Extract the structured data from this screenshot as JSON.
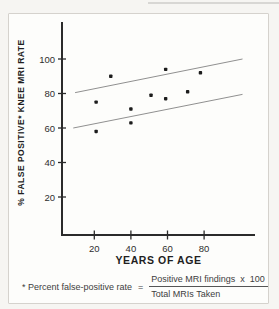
{
  "figure": {
    "y_axis_label": "% FALSE POSITIVE* KNEE MRI RATE",
    "x_axis_label": "YEARS OF AGE",
    "footnote": {
      "prefix": "* Percent false-positive rate",
      "equals": "=",
      "numerator": "Positive MRI findings  x  100",
      "denominator": "Total MRIs Taken"
    }
  },
  "chart_data": {
    "type": "scatter",
    "title": "",
    "xlabel": "YEARS OF AGE",
    "ylabel": "% FALSE POSITIVE* KNEE MRI RATE",
    "xlim": [
      0,
      108
    ],
    "ylim": [
      0,
      122
    ],
    "x_ticks": [
      20,
      40,
      60,
      80
    ],
    "y_ticks": [
      20,
      40,
      60,
      80,
      100
    ],
    "grid": false,
    "legend": "none",
    "points": [
      {
        "x": 21,
        "y": 75
      },
      {
        "x": 21,
        "y": 58
      },
      {
        "x": 29,
        "y": 90
      },
      {
        "x": 40,
        "y": 71
      },
      {
        "x": 40,
        "y": 63
      },
      {
        "x": 51,
        "y": 79
      },
      {
        "x": 59,
        "y": 94
      },
      {
        "x": 59,
        "y": 77
      },
      {
        "x": 71,
        "y": 81
      },
      {
        "x": 78,
        "y": 92
      }
    ],
    "band_lines": [
      {
        "x1": 9.5,
        "y1": 80.5,
        "x2": 101,
        "y2": 100
      },
      {
        "x1": 8.5,
        "y1": 60,
        "x2": 101,
        "y2": 79.5
      }
    ],
    "colors": {
      "point": "#1c1c1c",
      "band_line": "#909090",
      "axis": "#2b2b2b",
      "tick_label": "#2e2e2e"
    }
  }
}
